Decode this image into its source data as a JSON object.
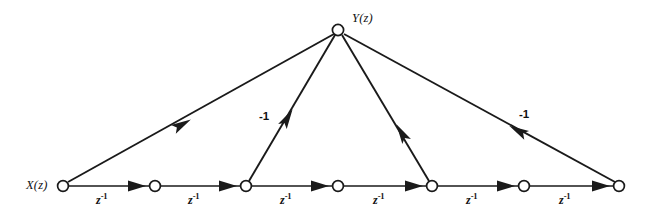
{
  "figure": {
    "type": "signal-flow-graph",
    "width": 656,
    "height": 217,
    "background_color": "#ffffff",
    "line_color": "#1a1a1a"
  },
  "labels": {
    "input": "X(z)",
    "output": "Y(z)",
    "delay": "z",
    "delay_exponent": "-1",
    "gain_negative_one": "-1"
  },
  "nodes": [
    {
      "id": "n0",
      "label": "X(z)",
      "x": 63,
      "y": 186,
      "role": "input"
    },
    {
      "id": "n1",
      "label": "",
      "x": 155,
      "y": 186,
      "role": "state"
    },
    {
      "id": "n2",
      "label": "",
      "x": 246,
      "y": 186,
      "role": "state"
    },
    {
      "id": "n3",
      "label": "",
      "x": 338,
      "y": 186,
      "role": "state"
    },
    {
      "id": "n4",
      "label": "",
      "x": 432,
      "y": 186,
      "role": "state"
    },
    {
      "id": "n5",
      "label": "",
      "x": 524,
      "y": 186,
      "role": "state"
    },
    {
      "id": "n6",
      "label": "",
      "x": 619,
      "y": 186,
      "role": "state"
    },
    {
      "id": "ny",
      "label": "Y(z)",
      "x": 338,
      "y": 30,
      "role": "output"
    }
  ],
  "delay_branches": [
    {
      "from": "n0",
      "to": "n1",
      "gain": "z",
      "exponent": "-1",
      "label_x": 104,
      "label_y": 200
    },
    {
      "from": "n1",
      "to": "n2",
      "gain": "z",
      "exponent": "-1",
      "label_x": 196,
      "label_y": 200
    },
    {
      "from": "n2",
      "to": "n3",
      "gain": "z",
      "exponent": "-1",
      "label_x": 288,
      "label_y": 200
    },
    {
      "from": "n3",
      "to": "n4",
      "gain": "z",
      "exponent": "-1",
      "label_x": 381,
      "label_y": 200
    },
    {
      "from": "n4",
      "to": "n5",
      "gain": "z",
      "exponent": "-1",
      "label_x": 474,
      "label_y": 200
    },
    {
      "from": "n5",
      "to": "n6",
      "gain": "z",
      "exponent": "-1",
      "label_x": 567,
      "label_y": 200
    }
  ],
  "diagonal_branches": [
    {
      "from": "n0",
      "to": "ny",
      "gain": "",
      "has_label": false,
      "label_x": 0,
      "label_y": 0
    },
    {
      "from": "n2",
      "to": "ny",
      "gain": "-1",
      "has_label": true,
      "label_x": 261,
      "label_y": 114
    },
    {
      "from": "n4",
      "to": "ny",
      "gain": "",
      "has_label": false,
      "label_x": 0,
      "label_y": 0
    },
    {
      "from": "n6",
      "to": "ny",
      "gain": "-1",
      "has_label": true,
      "label_x": 521,
      "label_y": 112
    }
  ]
}
